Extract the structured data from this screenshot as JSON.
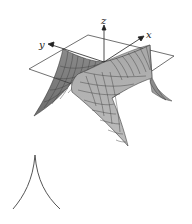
{
  "figure": {
    "axes": {
      "x_label": "x",
      "y_label": "y",
      "z_label": "z"
    },
    "colors": {
      "surface_dark": "#7a7a7a",
      "surface_light": "#b4b4b4",
      "grid_line": "#4a4a4a",
      "plane_edge": "#333333",
      "background": "#ffffff"
    },
    "cusp_curve": {
      "description": "Cross-section curve showing a cusp"
    }
  }
}
